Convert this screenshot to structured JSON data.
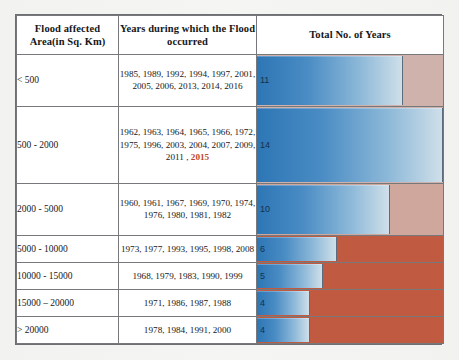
{
  "document": {
    "title": "Flood affected area frequency table",
    "page_background": "#f2f2f0"
  },
  "table": {
    "headers": {
      "area": "Flood affected Area(in Sq. Km)",
      "area_line1": "Flood affected",
      "area_line2": "Area(in Sq. Km)",
      "years": "Years during which the Flood occurred",
      "years_line1": "Years during which the Flood",
      "years_line2": "occurred",
      "total": "Total No. of Years"
    },
    "rows": [
      {
        "area": "< 500",
        "years_text": "1985, 1989, 1992, 1994, 1997, 2001, 2005, 2006, 2013, 2014, 2016",
        "years_line1": "1985, 1989, 1992, 1994, 1997, 2001,",
        "years_line2": "2005, 2006, 2013, 2014, 2016",
        "years_line3": "",
        "highlight_year": "",
        "total": 11,
        "total_label": "11",
        "bar_percent": 78.6,
        "rest_color": "#cfb2ab"
      },
      {
        "area": "500 - 2000",
        "years_text": "1962, 1963, 1964, 1965, 1966, 1972, 1975, 1996, 2003, 2004, 2007, 2009, 2011 , 2015",
        "years_line1": "1962, 1963, 1964, 1965, 1966, 1972,",
        "years_line2": "1975, 1996, 2003, 2004, 2007, 2009,",
        "years_line3": "2011 , ",
        "highlight_year": "2015",
        "total": 14,
        "total_label": "14",
        "bar_percent": 100,
        "rest_color": "#cfb2ab"
      },
      {
        "area": "2000 - 5000",
        "years_text": "1960, 1961, 1967, 1969, 1970, 1974, 1976, 1980, 1981, 1982",
        "years_line1": "1960, 1961, 1967, 1969, 1970, 1974,",
        "years_line2": "1976, 1980, 1981, 1982",
        "years_line3": "",
        "highlight_year": "",
        "total": 10,
        "total_label": "10",
        "bar_percent": 71.4,
        "rest_color": "#cfa79c"
      },
      {
        "area": "5000 - 10000",
        "years_text": "1973, 1977, 1993, 1995, 1998, 2008",
        "years_line1": "1973, 1977, 1993, 1995, 1998, 2008",
        "years_line2": "",
        "years_line3": "",
        "highlight_year": "",
        "total": 6,
        "total_label": "6",
        "bar_percent": 42.8,
        "rest_color": "#c05a40"
      },
      {
        "area": "10000 - 15000",
        "years_text": "1968, 1979, 1983, 1990, 1999",
        "years_line1": "1968, 1979, 1983, 1990, 1999",
        "years_line2": "",
        "years_line3": "",
        "highlight_year": "",
        "total": 5,
        "total_label": "5",
        "bar_percent": 35.7,
        "rest_color": "#c05a40"
      },
      {
        "area": "15000 – 20000",
        "years_text": "1971, 1986, 1987, 1988",
        "years_line1": "1971, 1986, 1987, 1988",
        "years_line2": "",
        "years_line3": "",
        "highlight_year": "",
        "total": 4,
        "total_label": "4",
        "bar_percent": 28.6,
        "rest_color": "#c05a40"
      },
      {
        "area": "> 20000",
        "years_text": "1978, 1984, 1991, 2000",
        "years_line1": "1978, 1984, 1991, 2000",
        "years_line2": "",
        "years_line3": "",
        "highlight_year": "",
        "total": 4,
        "total_label": "4",
        "bar_percent": 28.6,
        "rest_color": "#c05a40"
      }
    ]
  },
  "chart_data": {
    "type": "bar",
    "title": "Total No. of Years",
    "xlabel": "Total No. of Years",
    "ylabel": "Flood affected Area(in Sq. Km)",
    "orientation": "horizontal",
    "categories": [
      "< 500",
      "500 - 2000",
      "2000 - 5000",
      "5000 - 10000",
      "10000 - 15000",
      "15000 – 20000",
      "> 20000"
    ],
    "values": [
      11,
      14,
      10,
      6,
      5,
      4,
      4
    ],
    "xlim": [
      0,
      14
    ],
    "grid": false,
    "legend": false,
    "bar_gradient": [
      "#2d76b5",
      "#cfdfe9"
    ],
    "track_colors": [
      "#cfb2ab",
      "#cfb2ab",
      "#cfa79c",
      "#c05a40",
      "#c05a40",
      "#c05a40",
      "#c05a40"
    ],
    "data_labels": [
      "11",
      "14",
      "10",
      "6",
      "5",
      "4",
      "4"
    ]
  },
  "colors": {
    "bar_start": "#2d76b5",
    "bar_end": "#cfdfe9",
    "track_light": "#cfb2ab",
    "track_dark": "#c05a40",
    "border": "#76787b",
    "highlight_text": "#c0472a",
    "text": "#16181b"
  }
}
